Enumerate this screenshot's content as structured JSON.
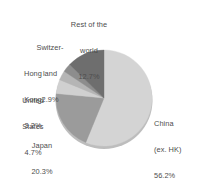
{
  "chart_data": {
    "type": "pie",
    "title": "",
    "subtitle": "",
    "xlabel": "",
    "ylabel": "",
    "legend_position": "none",
    "grid": false,
    "labels_outside": true,
    "start_angle_deg": 0,
    "direction": "clockwise",
    "categories": [
      "China (ex. HK)",
      "Japan",
      "United States",
      "Hong Kong",
      "Switzerland",
      "Rest of the world"
    ],
    "values": [
      56.2,
      20.3,
      4.7,
      3.2,
      2.9,
      12.7
    ],
    "units": "%",
    "slices": [
      {
        "name": "china",
        "label_lines": [
          "China",
          "(ex. HK)",
          "56.2%"
        ],
        "value": 56.2,
        "value_text": "56.2%",
        "color": "#d4d4d4"
      },
      {
        "name": "japan",
        "label_lines": [
          "Japan",
          "20.3%"
        ],
        "value": 20.3,
        "value_text": "20.3%",
        "color": "#9b9b9b"
      },
      {
        "name": "united-states",
        "label_lines": [
          "United",
          "States",
          "4.7%"
        ],
        "value": 4.7,
        "value_text": "4.7%",
        "color": "#d0d0d0"
      },
      {
        "name": "hong-kong",
        "label_lines": [
          "Hong",
          "Kong",
          "3.2%"
        ],
        "value": 3.2,
        "value_text": "3.2%",
        "color": "#b5b5b5"
      },
      {
        "name": "switzerland",
        "label_lines": [
          "Switzer-",
          "land",
          "2.9%"
        ],
        "value": 2.9,
        "value_text": "2.9%",
        "color": "#8d8d8d"
      },
      {
        "name": "rest-of-world",
        "label_lines": [
          "Rest of the",
          "world",
          "12.7%"
        ],
        "value": 12.7,
        "value_text": "12.7%",
        "color": "#6e6e6e"
      }
    ]
  },
  "labels": {
    "rest_of_world": {
      "line1": "Rest of the",
      "line2": "world",
      "line3": "12.7%"
    },
    "switzerland": {
      "line1": "Switzer-",
      "line2": "land",
      "line3": "2.9%"
    },
    "hong_kong": {
      "line1": "Hong",
      "line2": "Kong",
      "line3": "3.2%"
    },
    "united_states": {
      "line1": "United",
      "line2": "States",
      "line3": "4.7%"
    },
    "japan": {
      "line1": "Japan",
      "line2": "20.3%"
    },
    "china": {
      "line1": "China",
      "line2": "(ex. HK)",
      "line3": "56.2%"
    }
  },
  "style": {
    "background": "#ffffff",
    "text_color": "#4d4d4d",
    "shadow_color": "#bdbdbd"
  }
}
